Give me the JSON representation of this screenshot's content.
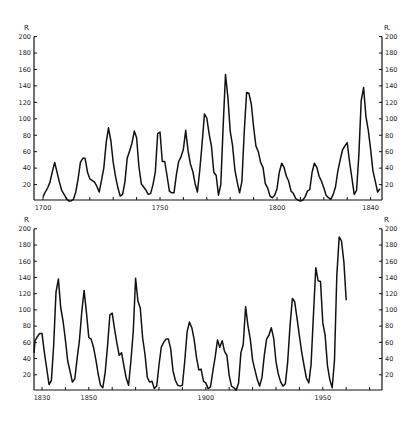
{
  "chart_data": [
    {
      "type": "line",
      "title": "",
      "panel": "top",
      "xlabel": "",
      "ylabel": "R",
      "xlim": [
        1696,
        1845
      ],
      "ylim": [
        0,
        200
      ],
      "x_ticks": [
        1700,
        1710,
        1720,
        1730,
        1740,
        1750,
        1760,
        1770,
        1780,
        1790,
        1800,
        1810,
        1820,
        1830,
        1840
      ],
      "x_tick_labels": [
        "1700",
        "1750",
        "1800",
        "1840"
      ],
      "y_ticks": [
        20,
        40,
        60,
        80,
        100,
        120,
        140,
        160,
        180,
        200
      ],
      "y_tick_labels": [
        "20",
        "40",
        "60",
        "80",
        "100",
        "120",
        "140",
        "160",
        "180",
        "200"
      ],
      "grid": false,
      "legend": null,
      "series": [
        {
          "name": "Sunspot number R (annual)",
          "x": [
            1700,
            1701,
            1702,
            1703,
            1704,
            1705,
            1706,
            1707,
            1708,
            1709,
            1710,
            1711,
            1712,
            1713,
            1714,
            1715,
            1716,
            1717,
            1718,
            1719,
            1720,
            1721,
            1722,
            1723,
            1724,
            1725,
            1726,
            1727,
            1728,
            1729,
            1730,
            1731,
            1732,
            1733,
            1734,
            1735,
            1736,
            1737,
            1738,
            1739,
            1740,
            1741,
            1742,
            1743,
            1744,
            1745,
            1746,
            1747,
            1748,
            1749,
            1750,
            1751,
            1752,
            1753,
            1754,
            1755,
            1756,
            1757,
            1758,
            1759,
            1760,
            1761,
            1762,
            1763,
            1764,
            1765,
            1766,
            1767,
            1768,
            1769,
            1770,
            1771,
            1772,
            1773,
            1774,
            1775,
            1776,
            1777,
            1778,
            1779,
            1780,
            1781,
            1782,
            1783,
            1784,
            1785,
            1786,
            1787,
            1788,
            1789,
            1790,
            1791,
            1792,
            1793,
            1794,
            1795,
            1796,
            1797,
            1798,
            1799,
            1800,
            1801,
            1802,
            1803,
            1804,
            1805,
            1806,
            1807,
            1808,
            1809,
            1810,
            1811,
            1812,
            1813,
            1814,
            1815,
            1816,
            1817,
            1818,
            1819,
            1820,
            1821,
            1822,
            1823,
            1824,
            1825,
            1826,
            1827,
            1828,
            1829,
            1830,
            1831,
            1832,
            1833,
            1834,
            1835,
            1836,
            1837,
            1838,
            1839,
            1840,
            1841,
            1842,
            1843,
            1844
          ],
          "values": [
            5,
            11,
            16,
            23,
            36,
            47,
            35,
            23,
            13,
            8,
            3,
            0,
            0,
            2,
            11,
            27,
            47,
            52,
            52,
            35,
            27,
            25,
            23,
            18,
            11,
            25,
            40,
            71,
            89,
            73,
            47,
            30,
            16,
            6,
            8,
            23,
            52,
            61,
            70,
            85,
            77,
            42,
            21,
            17,
            13,
            8,
            9,
            20,
            35,
            82,
            84,
            48,
            48,
            31,
            12,
            10,
            10,
            32,
            48,
            54,
            63,
            86,
            61,
            45,
            36,
            21,
            11,
            38,
            70,
            106,
            101,
            82,
            66,
            35,
            31,
            7,
            20,
            92,
            154,
            126,
            85,
            68,
            38,
            23,
            10,
            24,
            83,
            132,
            131,
            118,
            90,
            67,
            60,
            47,
            41,
            21,
            16,
            6,
            4,
            7,
            15,
            35,
            46,
            41,
            30,
            24,
            12,
            9,
            3,
            1,
            0,
            1,
            5,
            12,
            14,
            35,
            46,
            41,
            30,
            24,
            16,
            7,
            4,
            2,
            8,
            17,
            36,
            50,
            62,
            67,
            71,
            48,
            28,
            8,
            13,
            57,
            122,
            138,
            103,
            86,
            63,
            37,
            24,
            11,
            15
          ]
        }
      ]
    },
    {
      "type": "line",
      "title": "",
      "panel": "bottom",
      "xlabel": "",
      "ylabel": "R",
      "xlim": [
        1826,
        1975
      ],
      "ylim": [
        0,
        200
      ],
      "x_ticks": [
        1830,
        1840,
        1850,
        1860,
        1870,
        1880,
        1890,
        1900,
        1910,
        1920,
        1930,
        1940,
        1950,
        1960,
        1970
      ],
      "x_tick_labels": [
        "1830",
        "1850",
        "1900",
        "1950"
      ],
      "y_ticks": [
        20,
        40,
        60,
        80,
        100,
        120,
        140,
        160,
        180,
        200
      ],
      "y_tick_labels": [
        "20",
        "40",
        "60",
        "80",
        "100",
        "120",
        "140",
        "160",
        "180",
        "200"
      ],
      "grid": false,
      "legend": null,
      "series": [
        {
          "name": "Sunspot number R (annual)",
          "x": [
            1826,
            1827,
            1828,
            1829,
            1830,
            1831,
            1832,
            1833,
            1834,
            1835,
            1836,
            1837,
            1838,
            1839,
            1840,
            1841,
            1842,
            1843,
            1844,
            1845,
            1846,
            1847,
            1848,
            1849,
            1850,
            1851,
            1852,
            1853,
            1854,
            1855,
            1856,
            1857,
            1858,
            1859,
            1860,
            1861,
            1862,
            1863,
            1864,
            1865,
            1866,
            1867,
            1868,
            1869,
            1870,
            1871,
            1872,
            1873,
            1874,
            1875,
            1876,
            1877,
            1878,
            1879,
            1880,
            1881,
            1882,
            1883,
            1884,
            1885,
            1886,
            1887,
            1888,
            1889,
            1890,
            1891,
            1892,
            1893,
            1894,
            1895,
            1896,
            1897,
            1898,
            1899,
            1900,
            1901,
            1902,
            1903,
            1904,
            1905,
            1906,
            1907,
            1908,
            1909,
            1910,
            1911,
            1912,
            1913,
            1914,
            1915,
            1916,
            1917,
            1918,
            1919,
            1920,
            1921,
            1922,
            1923,
            1924,
            1925,
            1926,
            1927,
            1928,
            1929,
            1930,
            1931,
            1932,
            1933,
            1934,
            1935,
            1936,
            1937,
            1938,
            1939,
            1940,
            1941,
            1942,
            1943,
            1944,
            1945,
            1946,
            1947,
            1948,
            1949,
            1950,
            1951,
            1952,
            1953,
            1954,
            1955,
            1956,
            1957,
            1958,
            1959,
            1960
          ],
          "values": [
            47,
            62,
            67,
            71,
            71,
            48,
            28,
            8,
            13,
            57,
            122,
            138,
            103,
            86,
            63,
            37,
            24,
            11,
            15,
            40,
            62,
            98,
            124,
            96,
            66,
            64,
            54,
            39,
            21,
            7,
            4,
            23,
            55,
            94,
            96,
            77,
            59,
            44,
            47,
            31,
            16,
            7,
            37,
            74,
            139,
            111,
            102,
            66,
            45,
            17,
            11,
            12,
            3,
            6,
            32,
            54,
            60,
            64,
            64,
            52,
            25,
            13,
            7,
            6,
            7,
            36,
            73,
            85,
            78,
            64,
            42,
            26,
            27,
            12,
            10,
            3,
            5,
            24,
            42,
            63,
            54,
            62,
            49,
            44,
            19,
            6,
            4,
            1,
            10,
            47,
            57,
            104,
            81,
            64,
            38,
            26,
            14,
            6,
            17,
            44,
            64,
            69,
            78,
            65,
            36,
            21,
            11,
            6,
            9,
            36,
            80,
            114,
            110,
            89,
            68,
            48,
            31,
            16,
            10,
            33,
            93,
            152,
            136,
            135,
            84,
            69,
            31,
            14,
            4,
            38,
            142,
            190,
            185,
            159,
            112
          ]
        }
      ]
    }
  ],
  "panels": {
    "top": {
      "y_axis_label_left": "R",
      "y_axis_label_right": "R.",
      "x_labels": [
        {
          "text": "1700",
          "year": 1700
        },
        {
          "text": "1750",
          "year": 1750
        },
        {
          "text": "1800",
          "year": 1800
        },
        {
          "text": "1840",
          "year": 1840
        }
      ],
      "y_labels": [
        "20",
        "40",
        "60",
        "80",
        "100",
        "120",
        "140",
        "160",
        "180",
        "200"
      ]
    },
    "bottom": {
      "y_axis_label_left": "R",
      "y_axis_label_right": "R",
      "x_labels": [
        {
          "text": "1830",
          "year": 1830
        },
        {
          "text": "1850",
          "year": 1850
        },
        {
          "text": "1900",
          "year": 1900
        },
        {
          "text": "1950",
          "year": 1950
        }
      ],
      "y_labels": [
        "20",
        "40",
        "60",
        "80",
        "100",
        "120",
        "140",
        "160",
        "180",
        "200"
      ]
    }
  }
}
